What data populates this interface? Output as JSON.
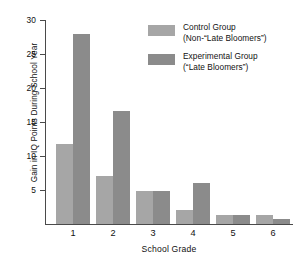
{
  "chart_data": {
    "type": "bar",
    "title": "",
    "xlabel": "School Grade",
    "ylabel": "Gain in IQ Points During School Year",
    "categories": [
      "1",
      "2",
      "3",
      "4",
      "5",
      "6"
    ],
    "ylim": [
      0,
      30
    ],
    "yticks": [
      5,
      10,
      15,
      20,
      25,
      30
    ],
    "ytick_labels": [
      "5",
      "10",
      "15",
      "20",
      "25",
      "30"
    ],
    "grid": false,
    "legend_position": "upper-right",
    "series": [
      {
        "name": "Control Group (Non-\"Late Bloomers\")",
        "color": "#a6a6a6",
        "values": [
          11.8,
          7.0,
          4.8,
          2.1,
          1.3,
          1.3
        ]
      },
      {
        "name": "Experimental Group (\"Late Bloomers\")",
        "color": "#8b8b8b",
        "values": [
          27.9,
          16.6,
          4.8,
          6.0,
          1.3,
          0.8
        ]
      }
    ]
  },
  "legend": {
    "entries": [
      {
        "line1": "Control Group",
        "line2": "(Non-“Late Bloomers”)",
        "swatch_color": "#a6a6a6"
      },
      {
        "line1": "Experimental Group",
        "line2": "(“Late Bloomers”)",
        "swatch_color": "#8b8b8b"
      }
    ]
  },
  "axes": {
    "y_title": "Gain in IQ Points During School Year",
    "x_title": "School Grade",
    "y_labels": [
      "30",
      "25",
      "20",
      "15",
      "10",
      "5"
    ],
    "x_labels": [
      "1",
      "2",
      "3",
      "4",
      "5",
      "6"
    ]
  },
  "colors": {
    "control": "#a6a6a6",
    "experimental": "#8b8b8b",
    "axis": "#4a4a4a",
    "text": "#111111",
    "background": "#ffffff"
  }
}
